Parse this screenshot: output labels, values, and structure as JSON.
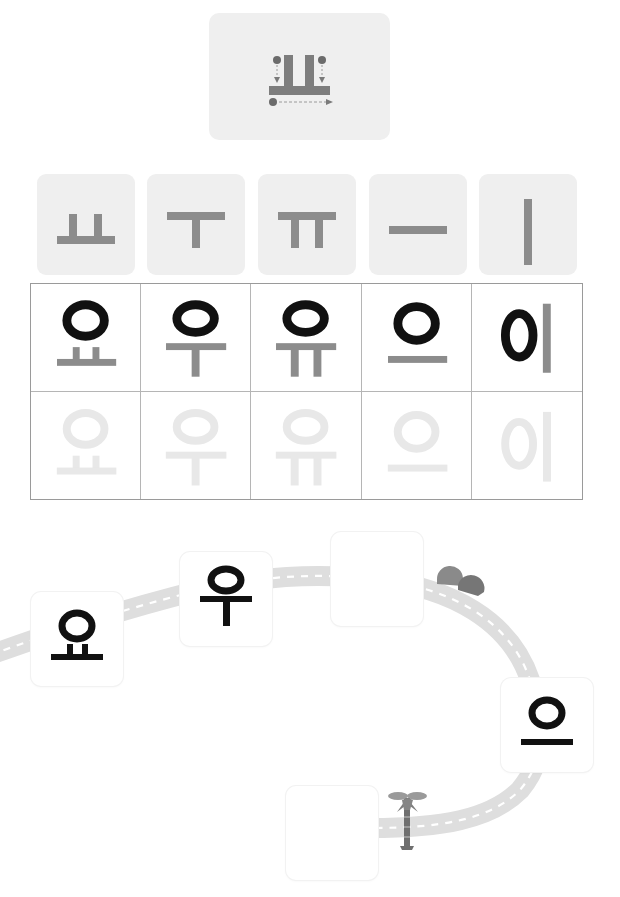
{
  "guide": {
    "letter": "ㅛ",
    "stroke_steps": [
      "1",
      "2",
      "3"
    ],
    "step_colors": {
      "stroke": "#5a5a5a",
      "arrow": "#8a8a8a"
    }
  },
  "vowel_tiles": [
    {
      "letter": "ㅛ"
    },
    {
      "letter": "ㅜ"
    },
    {
      "letter": "ㅠ"
    },
    {
      "letter": "ㅡ"
    },
    {
      "letter": "ㅣ"
    }
  ],
  "practice_grid": {
    "row_example": [
      {
        "syllable": "요",
        "consonant": "ㅇ",
        "vowel": "ㅛ"
      },
      {
        "syllable": "우",
        "consonant": "ㅇ",
        "vowel": "ㅜ"
      },
      {
        "syllable": "유",
        "consonant": "ㅇ",
        "vowel": "ㅠ"
      },
      {
        "syllable": "으",
        "consonant": "ㅇ",
        "vowel": "ㅡ"
      },
      {
        "syllable": "이",
        "consonant": "ㅇ",
        "vowel": "ㅣ"
      }
    ],
    "row_trace": [
      {
        "syllable": "요"
      },
      {
        "syllable": "우"
      },
      {
        "syllable": "유"
      },
      {
        "syllable": "으"
      },
      {
        "syllable": "이"
      }
    ]
  },
  "road": {
    "stops": [
      {
        "id": "stop-1",
        "syllable": "요",
        "filled": true
      },
      {
        "id": "stop-2",
        "syllable": "우",
        "filled": true
      },
      {
        "id": "stop-3",
        "syllable": "",
        "filled": false
      },
      {
        "id": "stop-4",
        "syllable": "으",
        "filled": true
      },
      {
        "id": "stop-5",
        "syllable": "",
        "filled": false
      }
    ],
    "decorations": [
      "bush",
      "palm-tree"
    ]
  },
  "colors": {
    "vowel_gray": "#8c8c8c",
    "consonant_black": "#111111",
    "trace_gray": "#e6e6e6",
    "tile_bg": "#efefef",
    "road_gray": "#dcdcdc",
    "grid_line": "#b5b5b5"
  }
}
